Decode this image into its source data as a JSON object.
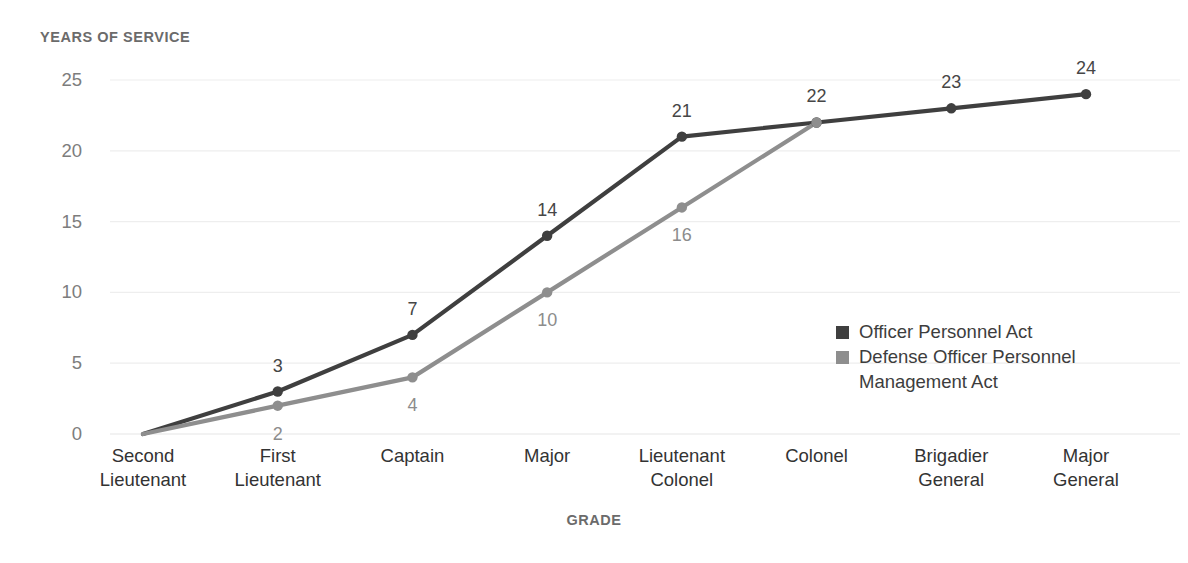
{
  "chart_data": {
    "type": "line",
    "title": "",
    "xlabel": "GRADE",
    "ylabel": "YEARS OF SERVICE",
    "categories": [
      "Second\nLieutenant",
      "First\nLieutenant",
      "Captain",
      "Major",
      "Lieutenant\nColonel",
      "Colonel",
      "Brigadier\nGeneral",
      "Major\nGeneral"
    ],
    "series": [
      {
        "name": "Officer Personnel Act",
        "color": "#3f3f3f",
        "values": [
          0,
          3,
          7,
          14,
          21,
          22,
          23,
          24
        ],
        "labels": [
          "",
          "3",
          "7",
          "14",
          "21",
          "22",
          "23",
          "24"
        ]
      },
      {
        "name": "Defense Officer Personnel\nManagement Act",
        "color": "#8e8e8e",
        "values": [
          0,
          2,
          4,
          10,
          16,
          22,
          null,
          null
        ],
        "labels": [
          "",
          "2",
          "4",
          "10",
          "16",
          "",
          "",
          ""
        ]
      }
    ],
    "ylim": [
      0,
      25
    ],
    "yticks": [
      0,
      5,
      10,
      15,
      20,
      25
    ],
    "ytick_labels": [
      "0",
      "5",
      "10",
      "15",
      "20",
      "25"
    ],
    "grid": true,
    "grid_color": "#eeeeee",
    "legend_position": "inside-right",
    "background": "#ffffff"
  },
  "legend": {
    "items": [
      {
        "label": "Officer Personnel Act",
        "color": "#3f3f3f"
      },
      {
        "label": "Defense Officer Personnel\nManagement Act",
        "color": "#8e8e8e"
      }
    ]
  }
}
